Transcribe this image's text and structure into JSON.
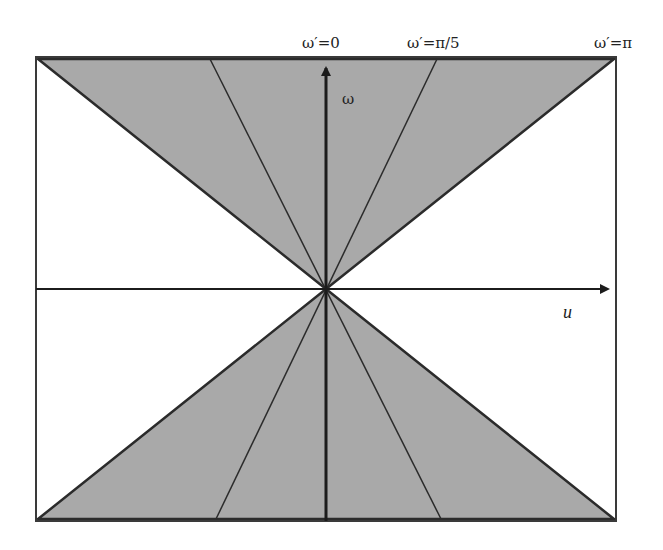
{
  "diagram": {
    "type": "frequency-domain wedge diagram",
    "colors": {
      "fill": "#a9a9a9",
      "stroke": "#2b2b2b",
      "frame": "#3a3a3a",
      "background": "#ffffff"
    },
    "axes": {
      "horizontal_label": "u",
      "vertical_label": "ω"
    },
    "top_labels": [
      {
        "text": "ω′=0",
        "x": 302
      },
      {
        "text": "ω′=π/5",
        "x": 407
      },
      {
        "text": "ω′=π",
        "x": 594
      }
    ],
    "frame": {
      "x1": 36,
      "y1": 57,
      "x2": 616,
      "y2": 521
    },
    "origin": {
      "x": 326,
      "y": 289
    },
    "wedges": [
      {
        "name": "upper",
        "points": [
          [
            36,
            57
          ],
          [
            616,
            57
          ],
          [
            326,
            289
          ]
        ]
      },
      {
        "name": "lower",
        "points": [
          [
            36,
            521
          ],
          [
            616,
            521
          ],
          [
            326,
            289
          ]
        ]
      }
    ],
    "rays": [
      {
        "top_x": 210,
        "bottom_x": 441,
        "description": "intermediate orientation line"
      },
      {
        "top_x": 437,
        "bottom_x": 216,
        "description": "ω′=π/5 line"
      }
    ]
  }
}
